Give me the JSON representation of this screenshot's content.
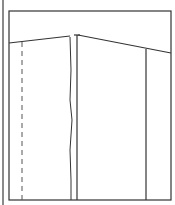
{
  "diagram": {
    "type": "pattern-piece-line-drawing",
    "stroke_color": "#333333",
    "edge_color": "#8a8a8a",
    "frame": {
      "x1": 9,
      "y1": 11,
      "x2": 171,
      "y2": 200
    },
    "top_line_left": {
      "x1": 9,
      "y1": 43,
      "x2": 70,
      "y2": 36
    },
    "top_line_right": {
      "x1": 78,
      "y1": 35,
      "x2": 171,
      "y2": 53
    },
    "verticals": [
      {
        "name": "dashed-guide",
        "x": 22,
        "style": "dashed"
      },
      {
        "name": "wavy-seam",
        "x": 71,
        "style": "wavy"
      },
      {
        "name": "center-line",
        "x": 77,
        "style": "solid"
      },
      {
        "name": "right-line",
        "x": 146,
        "style": "solid"
      }
    ]
  }
}
